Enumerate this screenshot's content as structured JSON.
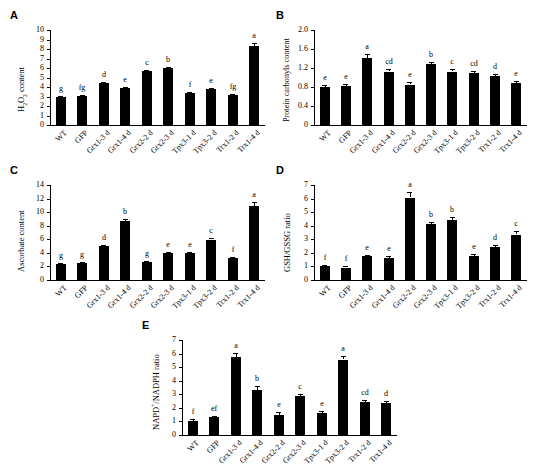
{
  "figure": {
    "categories": [
      "WT",
      "GFP",
      "Grx1-3 d",
      "Grx1-4 d",
      "Grx2-2 d",
      "Grx2-3 d",
      "Tpx3-1 d",
      "Tpx3-2 d",
      "Trx1-2 d",
      "Trx1-4 d"
    ],
    "bar_color": "#000000",
    "panel_letters": [
      "A",
      "B",
      "C",
      "D",
      "E"
    ]
  },
  "chart_data": [
    {
      "panel": "A",
      "type": "bar",
      "title": "",
      "ylabel": "H2O2 content",
      "ylabel_html": "H<sub>2</sub>O<sub>2</sub> content",
      "xlabel": "",
      "categories": [
        "WT",
        "GFP",
        "Grx1-3 d",
        "Grx1-4 d",
        "Grx2-2 d",
        "Grx2-3 d",
        "Tpx3-1 d",
        "Tpx3-2 d",
        "Trx1-2 d",
        "Trx1-4 d"
      ],
      "values": [
        3.0,
        3.1,
        4.45,
        3.9,
        5.65,
        6.0,
        3.4,
        3.75,
        3.15,
        8.35
      ],
      "errors": [
        0.1,
        0.1,
        0.12,
        0.12,
        0.18,
        0.15,
        0.12,
        0.12,
        0.1,
        0.28
      ],
      "sig_letters": [
        "g",
        "fg",
        "d",
        "e",
        "c",
        "b",
        "f",
        "e",
        "fg",
        "a"
      ],
      "ylim": [
        0,
        10
      ],
      "yticks": [
        0,
        1,
        2,
        3,
        4,
        5,
        6,
        7,
        8,
        9,
        10
      ],
      "ytick_labels": [
        "0",
        "1",
        "2",
        "3",
        "4",
        "5",
        "6",
        "7",
        "8",
        "9",
        "10"
      ],
      "grid": false,
      "legend": "none"
    },
    {
      "panel": "B",
      "type": "bar",
      "title": "",
      "ylabel": "Protein carbonyls content",
      "ylabel_html": "Protein carbonyls content",
      "xlabel": "",
      "categories": [
        "WT",
        "GFP",
        "Grx1-3 d",
        "Grx1-4 d",
        "Grx2-2 d",
        "Grx2-3 d",
        "Tpx3-1 d",
        "Tpx3-2 d",
        "Trx1-2 d",
        "Trx1-4 d"
      ],
      "values": [
        0.81,
        0.82,
        1.42,
        1.12,
        0.85,
        1.28,
        1.12,
        1.1,
        1.03,
        0.89
      ],
      "errors": [
        0.04,
        0.05,
        0.08,
        0.05,
        0.05,
        0.04,
        0.05,
        0.04,
        0.05,
        0.04
      ],
      "sig_letters": [
        "e",
        "e",
        "a",
        "cd",
        "e",
        "b",
        "c",
        "cd",
        "d",
        "e"
      ],
      "ylim": [
        0,
        2.0
      ],
      "yticks": [
        0,
        0.4,
        0.8,
        1.2,
        1.6,
        2.0
      ],
      "ytick_labels": [
        "0",
        "0.4",
        "0.8",
        "1.2",
        "1.6",
        "2.0"
      ],
      "grid": false,
      "legend": "none"
    },
    {
      "panel": "C",
      "type": "bar",
      "title": "",
      "ylabel": "Ascorbate content",
      "ylabel_html": "Ascorbate content",
      "xlabel": "",
      "categories": [
        "WT",
        "GFP",
        "Grx1-3 d",
        "Grx1-4 d",
        "Grx2-2 d",
        "Grx2-3 d",
        "Tpx3-1 d",
        "Tpx3-2 d",
        "Trx1-2 d",
        "Trx1-4 d"
      ],
      "values": [
        2.35,
        2.5,
        5.05,
        8.7,
        2.7,
        3.95,
        4.05,
        5.95,
        3.25,
        10.85
      ],
      "errors": [
        0.15,
        0.15,
        0.15,
        0.35,
        0.15,
        0.15,
        0.15,
        0.2,
        0.2,
        0.6
      ],
      "sig_letters": [
        "g",
        "g",
        "d",
        "b",
        "g",
        "e",
        "e",
        "c",
        "f",
        "a"
      ],
      "ylim": [
        0,
        14
      ],
      "yticks": [
        0,
        2,
        4,
        6,
        8,
        10,
        12,
        14
      ],
      "ytick_labels": [
        "0",
        "2",
        "4",
        "6",
        "8",
        "10",
        "12",
        "14"
      ],
      "grid": false,
      "legend": "none"
    },
    {
      "panel": "D",
      "type": "bar",
      "title": "",
      "ylabel": "GSH/GSSG ratio",
      "ylabel_html": "GSH/GSSG ratio",
      "xlabel": "",
      "categories": [
        "WT",
        "GFP",
        "Grx1-3 d",
        "Grx1-4 d",
        "Grx2-2 d",
        "Grx2-3 d",
        "Tpx3-1 d",
        "Tpx3-2 d",
        "Trx1-2 d",
        "Trx1-4 d"
      ],
      "values": [
        1.0,
        0.92,
        1.75,
        1.62,
        6.05,
        4.1,
        4.45,
        1.78,
        2.4,
        3.35
      ],
      "errors": [
        0.12,
        0.1,
        0.12,
        0.12,
        0.4,
        0.15,
        0.2,
        0.15,
        0.15,
        0.25
      ],
      "sig_letters": [
        "f",
        "f",
        "e",
        "e",
        "a",
        "b",
        "b",
        "e",
        "d",
        "c"
      ],
      "ylim": [
        0,
        7
      ],
      "yticks": [
        0,
        1,
        2,
        3,
        4,
        5,
        6,
        7
      ],
      "ytick_labels": [
        "0",
        "1",
        "2",
        "3",
        "4",
        "5",
        "6",
        "7"
      ],
      "grid": false,
      "legend": "none"
    },
    {
      "panel": "E",
      "type": "bar",
      "title": "",
      "ylabel": "NAPD+/NADPH ratio",
      "ylabel_html": "NAPD<sup>+</sup>/NADPH ratio",
      "xlabel": "",
      "categories": [
        "WT",
        "GFP",
        "Grx1-3 d",
        "Grx1-4 d",
        "Grx2-2 d",
        "Grx2-3 d",
        "Tpx3-1 d",
        "Tpx3-2 d",
        "Trx1-2 d",
        "Trx1-4 d"
      ],
      "values": [
        1.0,
        1.3,
        5.75,
        3.3,
        1.5,
        2.85,
        1.65,
        5.55,
        2.45,
        2.35
      ],
      "errors": [
        0.15,
        0.1,
        0.3,
        0.3,
        0.2,
        0.2,
        0.15,
        0.25,
        0.15,
        0.12
      ],
      "sig_letters": [
        "f",
        "ef",
        "a",
        "b",
        "e",
        "c",
        "e",
        "a",
        "cd",
        "d"
      ],
      "ylim": [
        0,
        7
      ],
      "yticks": [
        0,
        1,
        2,
        3,
        4,
        5,
        6,
        7
      ],
      "ytick_labels": [
        "0",
        "1",
        "2",
        "3",
        "4",
        "5",
        "6",
        "7"
      ],
      "grid": false,
      "legend": "none"
    }
  ]
}
